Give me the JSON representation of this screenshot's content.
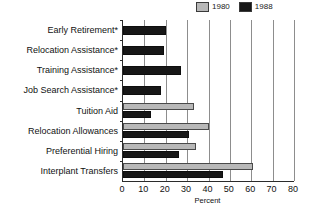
{
  "chart_data": {
    "type": "bar",
    "orientation": "horizontal",
    "title": "",
    "subtitle": "",
    "xlabel": "Percent",
    "ylabel": "",
    "xlim": [
      0,
      80
    ],
    "xticks": [
      0,
      10,
      20,
      30,
      40,
      50,
      60,
      70,
      80
    ],
    "grid": true,
    "grid_axis": "x",
    "legend_position": "top-right",
    "categories": [
      "Early Retirement*",
      "Relocation Assistance*",
      "Training Assistance*",
      "Job Search Assistance*",
      "Tuition Aid",
      "Relocation Allowances",
      "Preferential Hiring",
      "Interplant Transfers"
    ],
    "series": [
      {
        "name": "1980",
        "color": "#b8b8b8",
        "values": [
          null,
          null,
          null,
          null,
          33,
          40,
          34,
          61
        ]
      },
      {
        "name": "1988",
        "color": "#171717",
        "values": [
          20,
          19,
          27,
          18,
          13,
          31,
          26,
          47
        ]
      }
    ]
  },
  "legend": {
    "entries": [
      {
        "label": "1980",
        "swatch_name": "legend-swatch-1980"
      },
      {
        "label": "1988",
        "swatch_name": "legend-swatch-1988"
      }
    ]
  },
  "axis": {
    "x_title": "Percent",
    "tick_labels": [
      "0",
      "10",
      "20",
      "30",
      "40",
      "50",
      "60",
      "70",
      "80"
    ]
  },
  "colors": {
    "series_1980": "#b8b8b8",
    "series_1988": "#171717",
    "gridline": "#8d8d8d",
    "axis": "#2b2b2b",
    "background": "#ffffff",
    "text": "#111111"
  }
}
